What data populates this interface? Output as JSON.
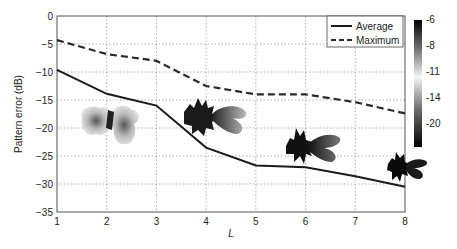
{
  "chart_data": {
    "type": "line",
    "title": "",
    "xlabel": "L",
    "ylabel": "Pattern error (dB)",
    "x": [
      1,
      2,
      3,
      4,
      5,
      6,
      7,
      8
    ],
    "xlim": [
      1,
      8
    ],
    "ylim": [
      -35,
      0
    ],
    "xticks": [
      1,
      2,
      3,
      4,
      5,
      6,
      7,
      8
    ],
    "yticks": [
      0,
      -5,
      -10,
      -15,
      -20,
      -25,
      -30,
      -35
    ],
    "grid": true,
    "legend_position": "upper right",
    "series": [
      {
        "name": "Average",
        "style": "solid",
        "color": "#1a1a1a",
        "values": [
          -9.6,
          -13.9,
          -16.0,
          -23.5,
          -26.7,
          -27.0,
          -28.6,
          -30.5
        ]
      },
      {
        "name": "Maximum",
        "style": "dashed",
        "color": "#2a2a2a",
        "values": [
          -4.3,
          -6.8,
          -8.0,
          -12.5,
          -14.0,
          -14.0,
          -15.4,
          -17.4
        ]
      }
    ],
    "colorbar": {
      "ticks": [
        "-6",
        "-8",
        "-11",
        "-14",
        "-20"
      ],
      "gradient": [
        "#000000",
        "#6e6e6e",
        "#f2f2f2",
        "#6e6e6e",
        "#000000"
      ]
    },
    "annotations": [
      {
        "type": "pattern-image",
        "near_x": 2,
        "shade": "light"
      },
      {
        "type": "pattern-image",
        "near_x": 4,
        "shade": "medium"
      },
      {
        "type": "pattern-image",
        "near_x": 6,
        "shade": "dark"
      },
      {
        "type": "pattern-image",
        "near_x": 8,
        "shade": "darkest"
      }
    ]
  }
}
